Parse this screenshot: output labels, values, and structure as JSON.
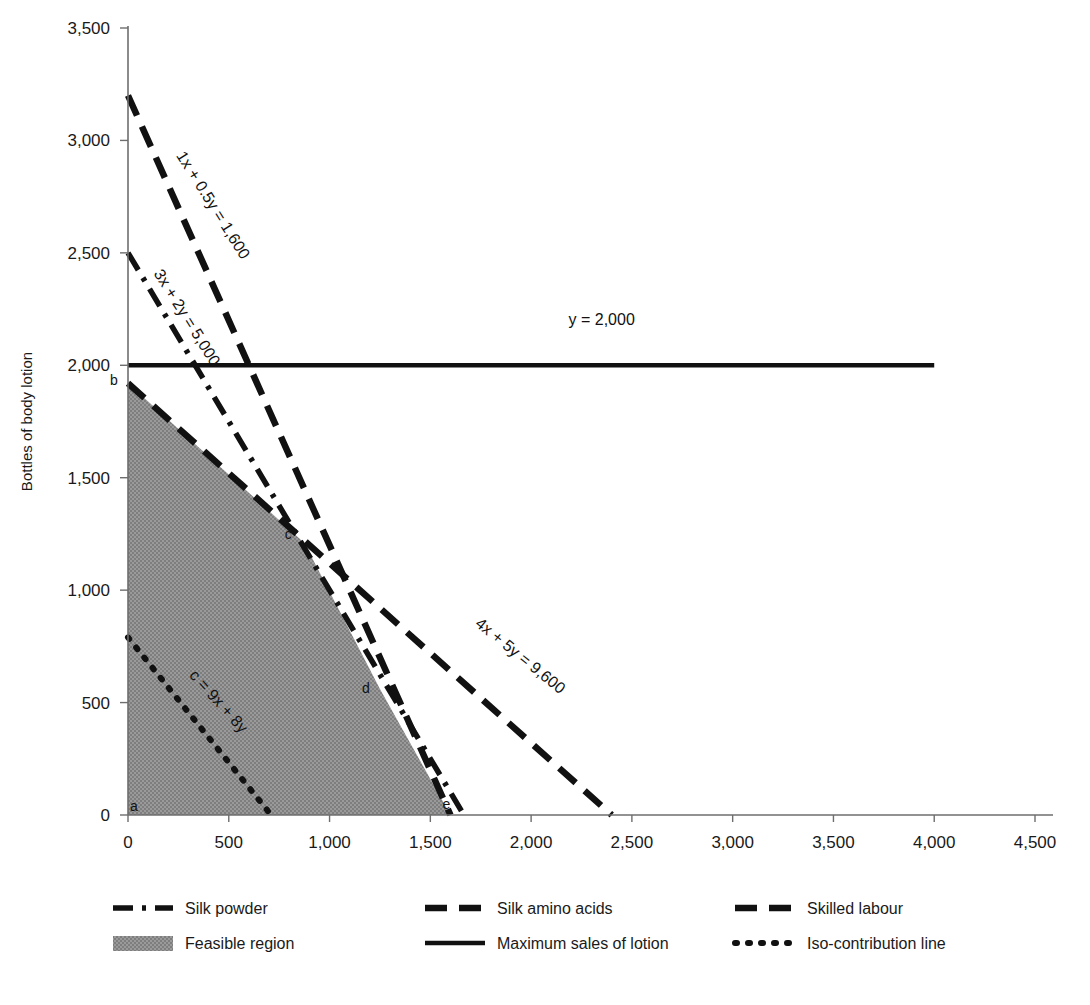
{
  "chart_data": {
    "type": "line",
    "title": "",
    "xlabel": "",
    "ylabel": "Bottles of body lotion",
    "xlim": [
      0,
      4500
    ],
    "ylim": [
      0,
      3500
    ],
    "grid": false,
    "legend_position": "bottom",
    "x_ticks": [
      "0",
      "500",
      "1,000",
      "1,500",
      "2,000",
      "2,500",
      "3,000",
      "3,500",
      "4,000",
      "4,500"
    ],
    "x_tick_values": [
      0,
      500,
      1000,
      1500,
      2000,
      2500,
      3000,
      3500,
      4000,
      4500
    ],
    "y_ticks": [
      "0",
      "500",
      "1,000",
      "1,500",
      "2,000",
      "2,500",
      "3,000",
      "3,500"
    ],
    "y_tick_values": [
      0,
      500,
      1000,
      1500,
      2000,
      2500,
      3000,
      3500
    ],
    "series": [
      {
        "name": "Silk powder",
        "equation": "3x + 2y = 5,000",
        "style": "dash-dot-dot",
        "points": [
          [
            0,
            2500
          ],
          [
            1666.7,
            0
          ]
        ]
      },
      {
        "name": "Silk amino acids",
        "equation": "1x + 0.5y = 1,600",
        "style": "dashed-long",
        "points": [
          [
            0,
            3200
          ],
          [
            1600,
            0
          ]
        ]
      },
      {
        "name": "Skilled labour",
        "equation": "4x + 5y = 9,600",
        "style": "dashed-long",
        "points": [
          [
            0,
            1920
          ],
          [
            2400,
            0
          ]
        ]
      },
      {
        "name": "Maximum sales of lotion",
        "equation": "y = 2,000",
        "style": "solid",
        "points": [
          [
            0,
            2000
          ],
          [
            4000,
            2000
          ]
        ]
      },
      {
        "name": "Iso-contribution line",
        "equation": "c = 9x + 8y",
        "style": "dotted",
        "points": [
          [
            0,
            790
          ],
          [
            710,
            0
          ]
        ]
      }
    ],
    "feasible_region": {
      "name": "Feasible region",
      "fill": "#909090",
      "vertices": [
        [
          0,
          0
        ],
        [
          0,
          1920
        ],
        [
          875,
          1210
        ],
        [
          1250,
          560
        ],
        [
          1600,
          0
        ]
      ]
    },
    "vertex_markers": [
      {
        "label": "a",
        "x": 0,
        "y": 0
      },
      {
        "label": "b",
        "x": 0,
        "y": 1920
      },
      {
        "label": "c",
        "x": 875,
        "y": 1210
      },
      {
        "label": "d",
        "x": 1250,
        "y": 560
      },
      {
        "label": "e",
        "x": 1600,
        "y": 0
      }
    ],
    "annotations": [
      {
        "text": "1x + 0.5y = 1,600",
        "x": 400,
        "y": 2700,
        "rotation": 58
      },
      {
        "text": "3x + 2y = 5,000",
        "x": 270,
        "y": 2200,
        "rotation": 58
      },
      {
        "text": "y = 2,000",
        "x": 2350,
        "y": 2180,
        "rotation": 0
      },
      {
        "text": "4x + 5y = 9,600",
        "x": 1930,
        "y": 690,
        "rotation": 39
      },
      {
        "text": "c = 9x + 8y",
        "x": 430,
        "y": 490,
        "rotation": 48
      }
    ]
  },
  "axis": {
    "y_title": "Bottles of body lotion"
  },
  "legend": {
    "items": [
      {
        "label": "Silk powder",
        "style": "dash-dot-dot",
        "color": "#111111"
      },
      {
        "label": "Silk amino acids",
        "style": "dashed-long",
        "color": "#111111"
      },
      {
        "label": "Skilled labour",
        "style": "dashed-long",
        "color": "#111111"
      },
      {
        "label": "Feasible region",
        "style": "swatch",
        "color": "#909090"
      },
      {
        "label": "Maximum sales of lotion",
        "style": "solid",
        "color": "#111111"
      },
      {
        "label": "Iso-contribution line",
        "style": "dotted",
        "color": "#111111"
      }
    ]
  }
}
